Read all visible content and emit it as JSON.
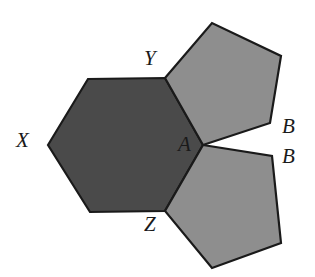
{
  "figure": {
    "background_color": "#ffffff",
    "outline_color": "#1a1a1a",
    "shapes": {
      "hexagon": {
        "name": "hexagon-XYZ",
        "fill_color": "#4a4a4a",
        "points": "48,145 88,79 165,78 203,145 165,211 90,212"
      },
      "pentagon_top": {
        "name": "pentagon-top-right",
        "fill_color": "#8e8e8e",
        "points": "165,78 212,23 281,56 270,123 203,145"
      },
      "pentagon_bottom": {
        "name": "pentagon-bottom-right",
        "fill_color": "#8e8e8e",
        "points": "203,145 272,156 281,243 212,268 165,211"
      }
    },
    "labels": {
      "X": "X",
      "Y": "Y",
      "Z": "Z",
      "A": "A",
      "B_upper": "B",
      "B_lower": "B"
    }
  }
}
